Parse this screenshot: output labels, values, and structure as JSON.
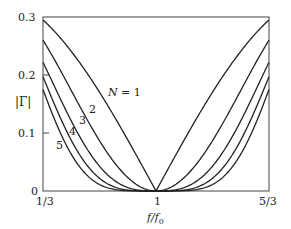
{
  "chart_data": {
    "type": "line",
    "title": "",
    "xlabel": "f/f0",
    "ylabel": "|Γ|",
    "xlim": [
      0.3333,
      1.6667
    ],
    "ylim": [
      0,
      0.3
    ],
    "x_ticks": [
      {
        "value": 0.3333,
        "label": "1/3"
      },
      {
        "value": 1.0,
        "label": "1"
      },
      {
        "value": 1.6667,
        "label": "5/3"
      }
    ],
    "y_ticks": [
      {
        "value": 0,
        "label": "0"
      },
      {
        "value": 0.1,
        "label": "0.1"
      },
      {
        "value": 0.2,
        "label": "0.2"
      },
      {
        "value": 0.3,
        "label": "0.3"
      }
    ],
    "grid": false,
    "legend": "inline labels",
    "x": [
      0.3333,
      0.5,
      0.6667,
      0.8333,
      1.0,
      1.1667,
      1.3333,
      1.5,
      1.6667
    ],
    "series": [
      {
        "name": "N = 1",
        "values": [
          0.295,
          0.24,
          0.17,
          0.088,
          0.0,
          0.088,
          0.17,
          0.24,
          0.295
        ]
      },
      {
        "name": "2",
        "values": [
          0.26,
          0.17,
          0.085,
          0.023,
          0.0,
          0.023,
          0.085,
          0.17,
          0.26
        ]
      },
      {
        "name": "3",
        "values": [
          0.222,
          0.12,
          0.043,
          0.006,
          0.0,
          0.006,
          0.043,
          0.12,
          0.222
        ]
      },
      {
        "name": "4",
        "values": [
          0.197,
          0.085,
          0.021,
          0.002,
          0.0,
          0.002,
          0.021,
          0.085,
          0.197
        ]
      },
      {
        "name": "5",
        "values": [
          0.175,
          0.06,
          0.011,
          0.0,
          0.0,
          0.0,
          0.011,
          0.06,
          0.175
        ]
      }
    ],
    "annotations": [
      "N = 1",
      "2",
      "3",
      "4",
      "5"
    ]
  },
  "labels": {
    "y_tick_0": "0",
    "y_tick_1": "0.1",
    "y_tick_2": "0.2",
    "y_tick_3": "0.3",
    "x_tick_left": "1/3",
    "x_tick_mid": "1",
    "x_tick_right": "5/3",
    "y_axis_label": "|Γ|",
    "x_axis_label_f": "f/f",
    "x_axis_label_sub": "0",
    "series_label_1": "N = 1",
    "series_label_2": "2",
    "series_label_3": "3",
    "series_label_4": "4",
    "series_label_5": "5"
  }
}
